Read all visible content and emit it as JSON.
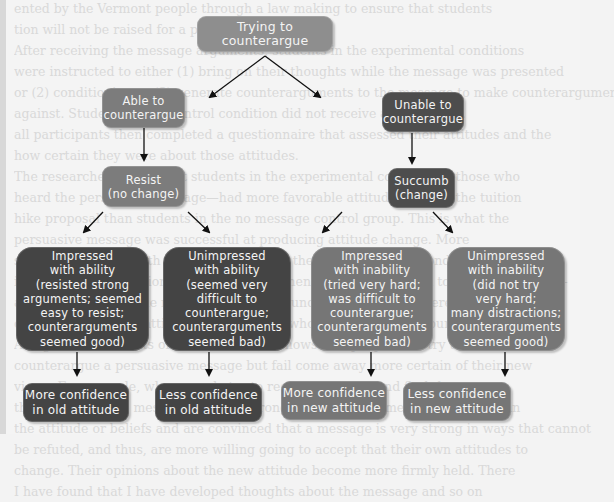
{
  "diagram": {
    "title": "Trying to counterargue",
    "nodes": {
      "root": {
        "label": "Trying to counterargue",
        "color": "#8e8e8e"
      },
      "able": {
        "label": "Able to\ncounterargue",
        "color": "#7c7c7c"
      },
      "unable": {
        "label": "Unable to\ncounterargue",
        "color": "#4d4d4d"
      },
      "resist": {
        "label": "Resist\n(no change)",
        "color": "#7c7c7c"
      },
      "succumb": {
        "label": "Succumb\n(change)",
        "color": "#4d4d4d"
      },
      "impressed_ability": {
        "label": "Impressed\nwith ability\n(resisted strong\narguments; seemed\neasy to resist;\ncounterarguments\nseemed good)",
        "color": "#444444"
      },
      "unimpressed_ability": {
        "label": "Unimpressed\nwith ability\n(seemed very\ndifficult to\ncounterargue;\ncounterarguments\nseemed bad)",
        "color": "#444444"
      },
      "impressed_inability": {
        "label": "Impressed\nwith inability\n(tried very hard;\nwas difficult to\ncounterargue;\ncounterarguments\nseemed bad)",
        "color": "#767676"
      },
      "unimpressed_inability": {
        "label": "Unimpressed\nwith inability\n(did not try\nvery hard;\nmany distractions;\ncounterarguments\nseemed good)",
        "color": "#767676"
      },
      "more_conf_old": {
        "label": "More confidence\nin old attitude",
        "color": "#444444"
      },
      "less_conf_old": {
        "label": "Less confidence\nin old attitude",
        "color": "#444444"
      },
      "more_conf_new": {
        "label": "More confidence\nin new attitude",
        "color": "#767676"
      },
      "less_conf_new": {
        "label": "Less confidence\nin new attitude",
        "color": "#767676"
      }
    },
    "edges": [
      {
        "from": "root",
        "to": "able"
      },
      {
        "from": "root",
        "to": "unable"
      },
      {
        "from": "able",
        "to": "resist"
      },
      {
        "from": "unable",
        "to": "succumb"
      },
      {
        "from": "resist",
        "to": "impressed_ability"
      },
      {
        "from": "resist",
        "to": "unimpressed_ability"
      },
      {
        "from": "succumb",
        "to": "impressed_inability"
      },
      {
        "from": "succumb",
        "to": "unimpressed_inability"
      },
      {
        "from": "impressed_ability",
        "to": "more_conf_old"
      },
      {
        "from": "unimpressed_ability",
        "to": "less_conf_old"
      },
      {
        "from": "impressed_inability",
        "to": "more_conf_new"
      },
      {
        "from": "unimpressed_inability",
        "to": "less_conf_new"
      }
    ]
  },
  "background_text": [
    "ented by the Vermont people through a law making to ensure that students",
    "tion will not be raised for a period of ten years.",
    "After receiving the message arguments, students in the experimental conditions",
    "were instructed to either (1) bring on their thoughts while the message was presented",
    "or (2) conditioning or (3) generate counterarguments to the message to make counterarguments",
    "against. Students in the control condition did not receive any message.",
    "all participants then completed a questionnaire that assessed their attitudes and the",
    "how certain they were about those attitudes.",
    "The researchers found that students in the experimental conditions—those who",
    "heard the persuasive message—had more favorable attitudes toward the tuition",
    "hike proposal than students in the no message control group. This is what the",
    "persuasive message was successful at producing attitude change. More",
    "students were left with greater certainty in the counterarguing condition than",
    "in the thought condition. In other words, when students were told to generate counter-",
    "arguments against the message and they found it difficult, they were more",
    "certain of their new attitude than students who had not tried to counterargue.",
    "Along with the results of other studies, it shows that people who try to",
    "counterargue a persuasive message but fail come away more certain of their new",
    "views. For example, when people try to resist a message and find they cannot,",
    "they infer that the message must be strong, and they become more confident in",
    "the attitude or beliefs and are convinced that a message is very strong in ways that cannot",
    "be refuted, and thus, are more willing going to accept that their own attitudes to",
    "change. Their opinions about the new attitude become more firmly held. There",
    "I have found that I have developed thoughts about the message and so on"
  ]
}
